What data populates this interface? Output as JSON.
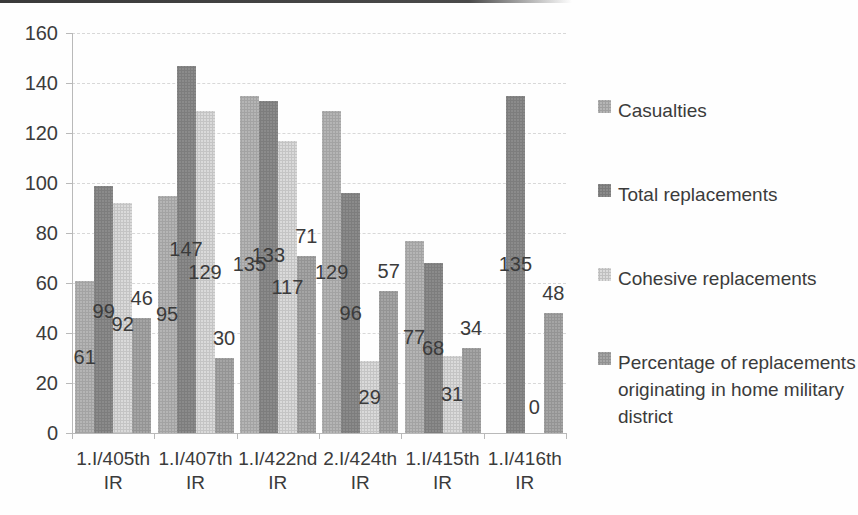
{
  "figure": {
    "kind": "scanned grayscale Excel-style clustered column chart",
    "background": "#fefefe",
    "text_color": "#3b3b3b",
    "gridline_color": "#d8d8d8",
    "axis_color": "#b9b9b9"
  },
  "chart_data": {
    "type": "bar",
    "title": "",
    "xlabel": "",
    "ylabel": "",
    "categories": [
      "1.I/405th IR",
      "1.I/407th IR",
      "1.I/422nd IR",
      "2.I/424th IR",
      "1.I/415th IR",
      "1.I/416th IR"
    ],
    "series": [
      {
        "name": "Casualties",
        "color": "#b5b5b5",
        "values": [
          61,
          95,
          135,
          129,
          77,
          null
        ],
        "label_position": "center"
      },
      {
        "name": "Total replacements",
        "color": "#8b8b8b",
        "values": [
          99,
          147,
          133,
          96,
          68,
          135
        ],
        "label_position": "center"
      },
      {
        "name": "Cohesive replacements",
        "color": "#dadada",
        "values": [
          92,
          129,
          117,
          29,
          31,
          0
        ],
        "label_position": "center"
      },
      {
        "name": "Percentage of replacements originating in home military district",
        "color": "#a5a5a5",
        "values": [
          46,
          30,
          71,
          57,
          34,
          48
        ],
        "label_position": "outside_end"
      }
    ],
    "y_axis": {
      "min": 0,
      "max": 160,
      "step": 20,
      "ticks": [
        0,
        20,
        40,
        60,
        80,
        100,
        120,
        140,
        160
      ]
    },
    "grid": true,
    "data_labels": true,
    "legend_position": "right",
    "legend_entries": [
      "Casualties",
      "Total replacements",
      "Cohesive replacements",
      "Percentage of replacements originating in home military district"
    ],
    "legend_wrap": {
      "3": [
        "Percentage of replacements",
        "originating in home military",
        "district"
      ]
    }
  }
}
